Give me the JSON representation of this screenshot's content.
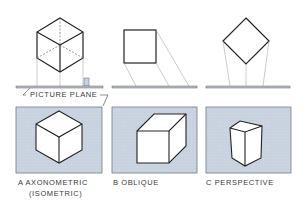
{
  "picture_plane_label": "PICTURE PLANE",
  "panels": [
    {
      "id": "A",
      "label": "A  AXONOMETRIC",
      "sublabel": "(ISOMETRIC)"
    },
    {
      "id": "B",
      "label": "B  OBLIQUE"
    },
    {
      "id": "C",
      "label": "C  PERSPECTIVE"
    }
  ],
  "colors": {
    "panel_fill": "#c9d3e1",
    "panel_border": "#6f7a86",
    "line": "#2a2a2a",
    "projector": "#9a9a9a",
    "plane": "#b7c0cc"
  }
}
